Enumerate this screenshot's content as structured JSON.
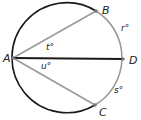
{
  "diagram": {
    "type": "circle-geometry",
    "circle": {
      "cx": 68,
      "cy": 58,
      "r": 55,
      "colors": {
        "arc_left": "#1a1a1a",
        "arc_right": "#9a9a9a"
      }
    },
    "points": [
      {
        "id": "A",
        "label": "A",
        "x": 13,
        "y": 58,
        "label_x": 3,
        "label_y": 62
      },
      {
        "id": "B",
        "label": "B",
        "x": 96,
        "y": 11,
        "label_x": 102,
        "label_y": 14
      },
      {
        "id": "D",
        "label": "D",
        "x": 123,
        "y": 59,
        "label_x": 129,
        "label_y": 64
      },
      {
        "id": "C",
        "label": "C",
        "x": 95,
        "y": 105,
        "label_x": 99,
        "label_y": 116
      }
    ],
    "segments": [
      {
        "from": "A",
        "to": "B",
        "color": "#9a9a9a"
      },
      {
        "from": "A",
        "to": "D",
        "color": "#1a1a1a"
      },
      {
        "from": "A",
        "to": "C",
        "color": "#9a9a9a"
      }
    ],
    "angle_labels": [
      {
        "id": "t",
        "text": "t°",
        "x": 46,
        "y": 50
      },
      {
        "id": "u",
        "text": "u°",
        "x": 41,
        "y": 69
      }
    ],
    "arc_labels": [
      {
        "id": "r",
        "text": "r°",
        "x": 121,
        "y": 31
      },
      {
        "id": "s",
        "text": "s°",
        "x": 114,
        "y": 93
      }
    ]
  }
}
